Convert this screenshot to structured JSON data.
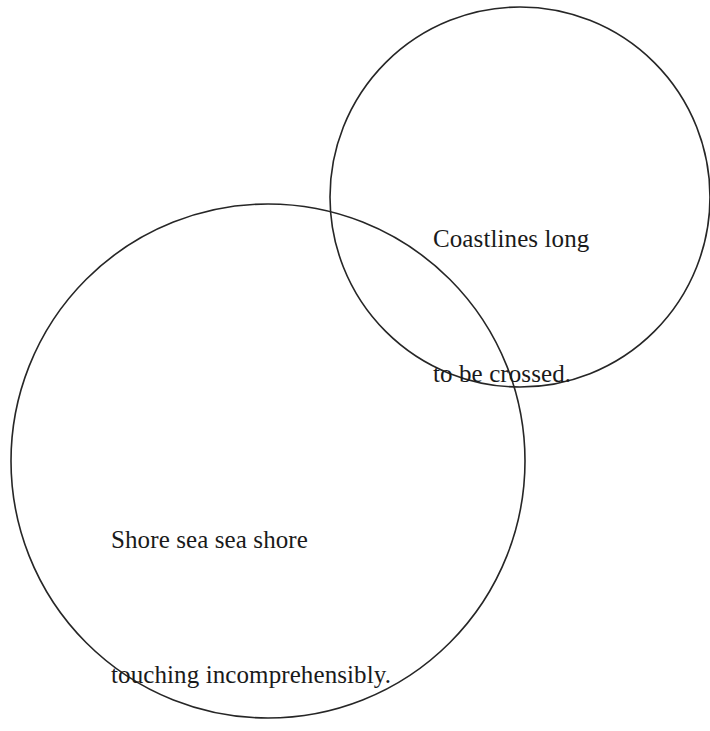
{
  "canvas": {
    "width": 710,
    "height": 731,
    "background_color": "#ffffff"
  },
  "diagram": {
    "type": "venn-two-circle",
    "stroke_color": "#262626",
    "stroke_width": 1.6,
    "fill": "none",
    "text_color": "#1a1a1a",
    "circles": [
      {
        "name": "top-right-circle",
        "cx": 520,
        "cy": 197,
        "r": 190
      },
      {
        "name": "bottom-left-circle",
        "cx": 268,
        "cy": 461,
        "r": 257
      }
    ]
  },
  "labels": {
    "top_right": {
      "line1": "Coastlines long",
      "line2": "to be crossed."
    },
    "bottom_left": {
      "line1": "Shore sea sea shore",
      "line2": "touching incomprehensibly."
    }
  }
}
